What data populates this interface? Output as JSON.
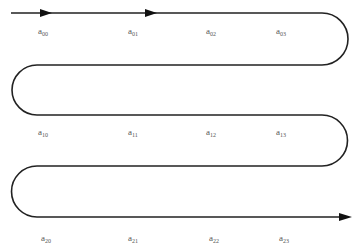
{
  "diagram": {
    "type": "serpentine-scan-path",
    "stroke_color": "#222222",
    "label_color": "#555555",
    "rows": [
      {
        "labels": [
          {
            "base": "a",
            "sub": "00",
            "x": 38,
            "y": 27
          },
          {
            "base": "a",
            "sub": "01",
            "x": 128,
            "y": 27
          },
          {
            "base": "a",
            "sub": "02",
            "x": 206,
            "y": 27
          },
          {
            "base": "a",
            "sub": "03",
            "x": 276,
            "y": 27
          }
        ]
      },
      {
        "labels": [
          {
            "base": "a",
            "sub": "10",
            "x": 38,
            "y": 128
          },
          {
            "base": "a",
            "sub": "11",
            "x": 128,
            "y": 128
          },
          {
            "base": "a",
            "sub": "12",
            "x": 206,
            "y": 128
          },
          {
            "base": "a",
            "sub": "13",
            "x": 276,
            "y": 128
          }
        ]
      },
      {
        "labels": [
          {
            "base": "a",
            "sub": "20",
            "x": 41,
            "y": 234
          },
          {
            "base": "a",
            "sub": "21",
            "x": 128,
            "y": 234
          },
          {
            "base": "a",
            "sub": "22",
            "x": 209,
            "y": 234
          },
          {
            "base": "a",
            "sub": "23",
            "x": 279,
            "y": 234
          }
        ]
      }
    ]
  }
}
